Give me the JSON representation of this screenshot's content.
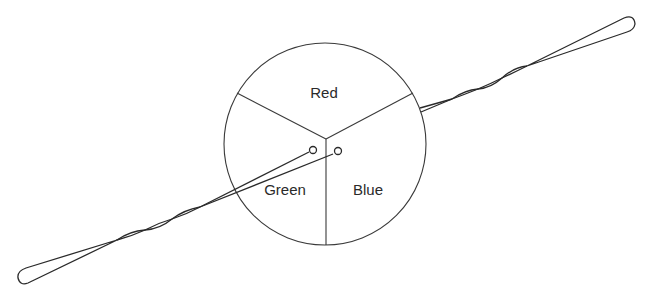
{
  "diagram": {
    "type": "color-wheel-with-twisted-wire-pair",
    "disk": {
      "sectors": [
        {
          "label": "Red",
          "position": "top"
        },
        {
          "label": "Green",
          "position": "lower-left"
        },
        {
          "label": "Blue",
          "position": "lower-right"
        }
      ]
    },
    "wire": {
      "description": "twisted wire loop passing through disk with two pin contacts near center",
      "contacts": 2
    },
    "colors": {
      "line": "#2a2a2a",
      "background": "#ffffff"
    }
  }
}
